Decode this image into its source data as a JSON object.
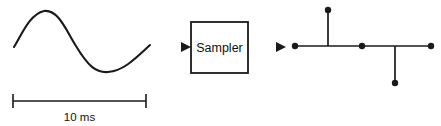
{
  "figure": {
    "ink_color": "#1a1a1a",
    "background_color": "#ffffff"
  },
  "input_signal": {
    "name": "analog-sine-wave",
    "path": "M 14 47 C 22 34, 30 14, 44 11 C 58 9, 66 30, 76 46 C 88 66, 96 73, 108 72 C 122 71, 132 62, 150 45",
    "scale_bar": {
      "label": "10 ms",
      "x_start": 13,
      "x_end": 146,
      "y": 101,
      "cap_half_height": 7
    }
  },
  "input_arrow": {
    "name": "input-arrow",
    "x_start": 157,
    "x_tip": 191,
    "y": 47
  },
  "sampler_block": {
    "label": "Sampler",
    "x": 191,
    "y": 22,
    "width": 57,
    "height": 51,
    "label_x": 219.5,
    "label_y": 52
  },
  "output_arrow": {
    "name": "output-arrow",
    "x_start": 248,
    "x_tip": 286,
    "y": 47
  },
  "chart_data": {
    "type": "scatter",
    "xlabel": "",
    "ylabel": "",
    "baseline_y": 46,
    "baseline_x_start": 295,
    "baseline_x_end": 431,
    "dot_radius": 3.2,
    "samples": [
      {
        "name": "sample-1",
        "x": 295,
        "y": 46,
        "stem": false
      },
      {
        "name": "sample-2",
        "x": 328,
        "y": 10,
        "stem": true
      },
      {
        "name": "sample-3",
        "x": 362,
        "y": 46,
        "stem": false
      },
      {
        "name": "sample-4",
        "x": 395,
        "y": 83,
        "stem": true
      },
      {
        "name": "sample-5",
        "x": 431,
        "y": 46,
        "stem": false
      }
    ]
  }
}
